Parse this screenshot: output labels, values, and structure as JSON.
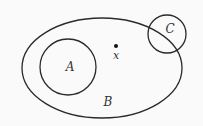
{
  "diagram": {
    "type": "venn",
    "stroke_color": "#2a2a2a",
    "background": "#fafafa",
    "sets": [
      {
        "id": "B",
        "label": "B",
        "shape": "ellipse",
        "cx": 102,
        "cy": 68,
        "rx": 80,
        "ry": 50,
        "label_x": 108,
        "label_y": 106
      },
      {
        "id": "A",
        "label": "A",
        "shape": "circle",
        "cx": 68,
        "cy": 67,
        "r": 28,
        "label_x": 70,
        "label_y": 71
      },
      {
        "id": "C",
        "label": "C",
        "shape": "circle",
        "cx": 167,
        "cy": 34,
        "r": 19,
        "label_x": 170,
        "label_y": 33
      }
    ],
    "points": [
      {
        "id": "x",
        "label": "x",
        "cx": 116,
        "cy": 46,
        "label_x": 116,
        "label_y": 59
      }
    ]
  }
}
